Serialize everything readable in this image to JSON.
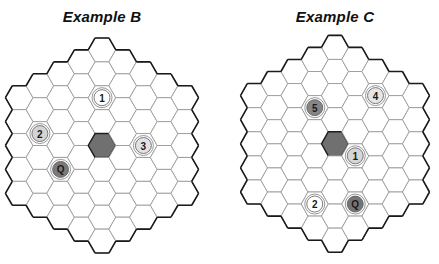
{
  "colors": {
    "background": "#ffffff",
    "grid_line": "#9a9a9a",
    "board_outline": "#1a1a1a",
    "center_cell": "#707070"
  },
  "examples": [
    {
      "title": "Example B",
      "board": {
        "radius": 4,
        "center_x": 102,
        "center_y": 145.5,
        "hex_side": 13.8,
        "row_height": 23.9,
        "offset_left": 0
      },
      "center_cell": {
        "q": 0,
        "r": 0
      },
      "pieces": [
        {
          "label": "1",
          "q": 0,
          "r": -2,
          "fill": "#ffffff"
        },
        {
          "label": "2",
          "q": -3,
          "r": 1,
          "fill": "#d4d4d4"
        },
        {
          "label": "3",
          "q": 2,
          "r": -1,
          "fill": "#e2e2e2"
        },
        {
          "label": "Q",
          "q": -2,
          "r": 2,
          "fill": "#7a7a7a"
        }
      ]
    },
    {
      "title": "Example C",
      "board": {
        "radius": 4,
        "center_x": 335,
        "center_y": 143.8,
        "hex_side": 13.5,
        "row_height": 24.1,
        "offset_left": 0
      },
      "center_cell": {
        "q": 0,
        "r": 0
      },
      "pieces": [
        {
          "label": "5",
          "q": -1,
          "r": -1,
          "fill": "#858585"
        },
        {
          "label": "4",
          "q": 2,
          "r": -3,
          "fill": "#e6e6e6"
        },
        {
          "label": "1",
          "q": 1,
          "r": 0,
          "fill": "#d6d6d6"
        },
        {
          "label": "2",
          "q": -1,
          "r": 3,
          "fill": "#ffffff"
        },
        {
          "label": "Q",
          "q": 1,
          "r": 2,
          "fill": "#757575"
        }
      ]
    }
  ]
}
